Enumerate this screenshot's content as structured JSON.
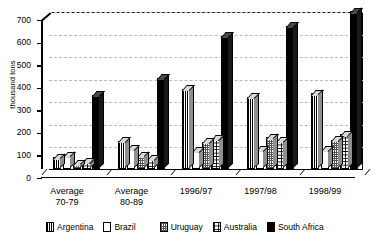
{
  "chart_data": {
    "type": "bar",
    "title": "",
    "subtitle": "",
    "xlabel": "",
    "ylabel": "thousand tons",
    "ylim": [
      0,
      700
    ],
    "yticks": [
      0,
      100,
      200,
      300,
      400,
      500,
      600,
      700
    ],
    "ytick_labels": [
      "0",
      "100",
      "200",
      "300",
      "400",
      "500",
      "600",
      "700"
    ],
    "grid": true,
    "legend_position": "bottom",
    "categories": [
      "Average\n70-79",
      "Average\n80-89",
      "1996/97",
      "1997/98",
      "1998/99"
    ],
    "category_labels": [
      {
        "line1": "Average",
        "line2": "70-79"
      },
      {
        "line1": "Average",
        "line2": "80-89"
      },
      {
        "line1": "1996/97",
        "line2": ""
      },
      {
        "line1": "1997/98",
        "line2": ""
      },
      {
        "line1": "1998/99",
        "line2": ""
      }
    ],
    "series": [
      {
        "name": "Argentina",
        "pattern": "vertical-stripes",
        "values": [
          52,
          125,
          355,
          320,
          335
        ]
      },
      {
        "name": "Brazil",
        "pattern": "solid-white",
        "values": [
          62,
          90,
          80,
          85,
          85
        ]
      },
      {
        "name": "Uruguay",
        "pattern": "cross-hatch",
        "values": [
          25,
          60,
          120,
          140,
          130
        ]
      },
      {
        "name": "Australia",
        "pattern": "dotted",
        "values": [
          32,
          45,
          135,
          125,
          155
        ]
      },
      {
        "name": "South Africa",
        "pattern": "solid-black",
        "values": [
          330,
          405,
          590,
          635,
          700
        ]
      }
    ]
  },
  "legend": {
    "items": [
      {
        "label": "Argentina"
      },
      {
        "label": "Brazil"
      },
      {
        "label": "Uruguay"
      },
      {
        "label": "Australia"
      },
      {
        "label": "South Africa"
      }
    ]
  },
  "colors": {
    "axis": "#000000",
    "grid": "#b9b9b9",
    "background": "#ffffff",
    "bar_top": "#d9d9d9",
    "bar_side": "#8f8f8f",
    "south_africa": "#000000"
  }
}
